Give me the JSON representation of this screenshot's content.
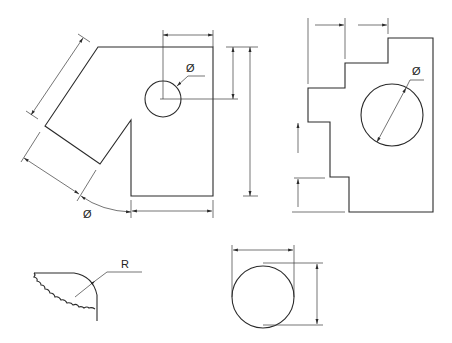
{
  "figures": [
    {
      "id": "angled-plate",
      "description": "Plate with angled arm, notch and hole",
      "labels": {
        "hole_diameter": "Ø",
        "arc_diameter": "Ø"
      }
    },
    {
      "id": "stepped-plate",
      "description": "Stepped plate with large hole",
      "labels": {
        "hole_diameter": "Ø"
      }
    },
    {
      "id": "rounded-corner",
      "description": "Broken-out corner with radius",
      "labels": {
        "radius": "R"
      }
    },
    {
      "id": "circle-extents",
      "description": "Circle dimensioned by overall width and height",
      "labels": {}
    }
  ],
  "colors": {
    "line": "#2a2a2a",
    "background": "#ffffff"
  }
}
